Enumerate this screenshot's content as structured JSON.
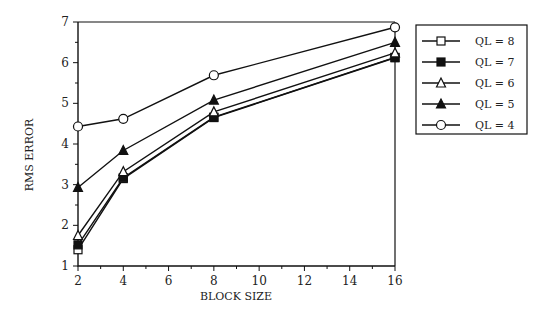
{
  "chart_data": {
    "type": "line",
    "title": "",
    "xlabel": "BLOCK SIZE",
    "ylabel": "RMS ERROR",
    "x": [
      2,
      4,
      8,
      16
    ],
    "xlim": [
      2,
      16
    ],
    "ylim": [
      1,
      7
    ],
    "xticks": [
      2,
      4,
      6,
      8,
      10,
      12,
      14,
      16
    ],
    "yticks": [
      1,
      2,
      3,
      4,
      5,
      6,
      7
    ],
    "grid": false,
    "legend_position": "right",
    "series": [
      {
        "name": "QL = 8",
        "marker": "open-square",
        "values": [
          1.4,
          3.15,
          4.65,
          6.12
        ]
      },
      {
        "name": "QL = 7",
        "marker": "filled-square",
        "values": [
          1.52,
          3.17,
          4.66,
          6.13
        ]
      },
      {
        "name": "QL = 6",
        "marker": "open-triangle",
        "values": [
          1.75,
          3.32,
          4.79,
          6.24
        ]
      },
      {
        "name": "QL = 5",
        "marker": "filled-triangle",
        "values": [
          2.93,
          3.84,
          5.08,
          6.5
        ]
      },
      {
        "name": "QL = 4",
        "marker": "open-circle",
        "values": [
          4.43,
          4.62,
          5.69,
          6.87
        ]
      }
    ]
  }
}
